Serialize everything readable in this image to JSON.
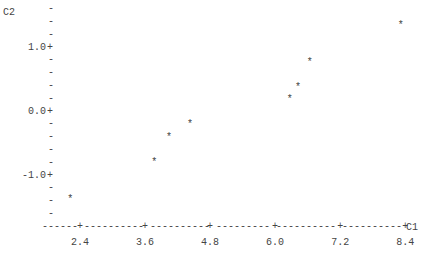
{
  "chart_data": {
    "type": "scatter",
    "title": "",
    "style": "character plot",
    "xlabel": "C1",
    "ylabel": "C2",
    "xlim": [
      1.9,
      8.4
    ],
    "ylim": [
      -1.6,
      1.6
    ],
    "x_ticks": [
      2.4,
      3.6,
      4.8,
      6.0,
      7.2,
      8.4
    ],
    "x_tick_labels": [
      "2.4",
      "3.6",
      "4.8",
      "6.0",
      "7.2",
      "8.4"
    ],
    "y_ticks": [
      1.0,
      0.0,
      -1.0
    ],
    "y_tick_labels": [
      "1.0",
      "0.0",
      "-1.0"
    ],
    "y_minor_per_major": 5,
    "x_minor_per_major": 0,
    "marker": "*",
    "grid": false,
    "legend": "none",
    "series": [
      {
        "name": "C2 vs C1",
        "points": [
          {
            "x": 2.22,
            "y": -1.36
          },
          {
            "x": 3.77,
            "y": -0.78
          },
          {
            "x": 4.04,
            "y": -0.39
          },
          {
            "x": 4.43,
            "y": -0.19
          },
          {
            "x": 6.27,
            "y": 0.2
          },
          {
            "x": 6.42,
            "y": 0.39
          },
          {
            "x": 6.64,
            "y": 0.78
          },
          {
            "x": 8.32,
            "y": 1.36
          }
        ]
      }
    ],
    "axis_chars": {
      "major": "+",
      "minor": "-",
      "line": "-"
    }
  }
}
